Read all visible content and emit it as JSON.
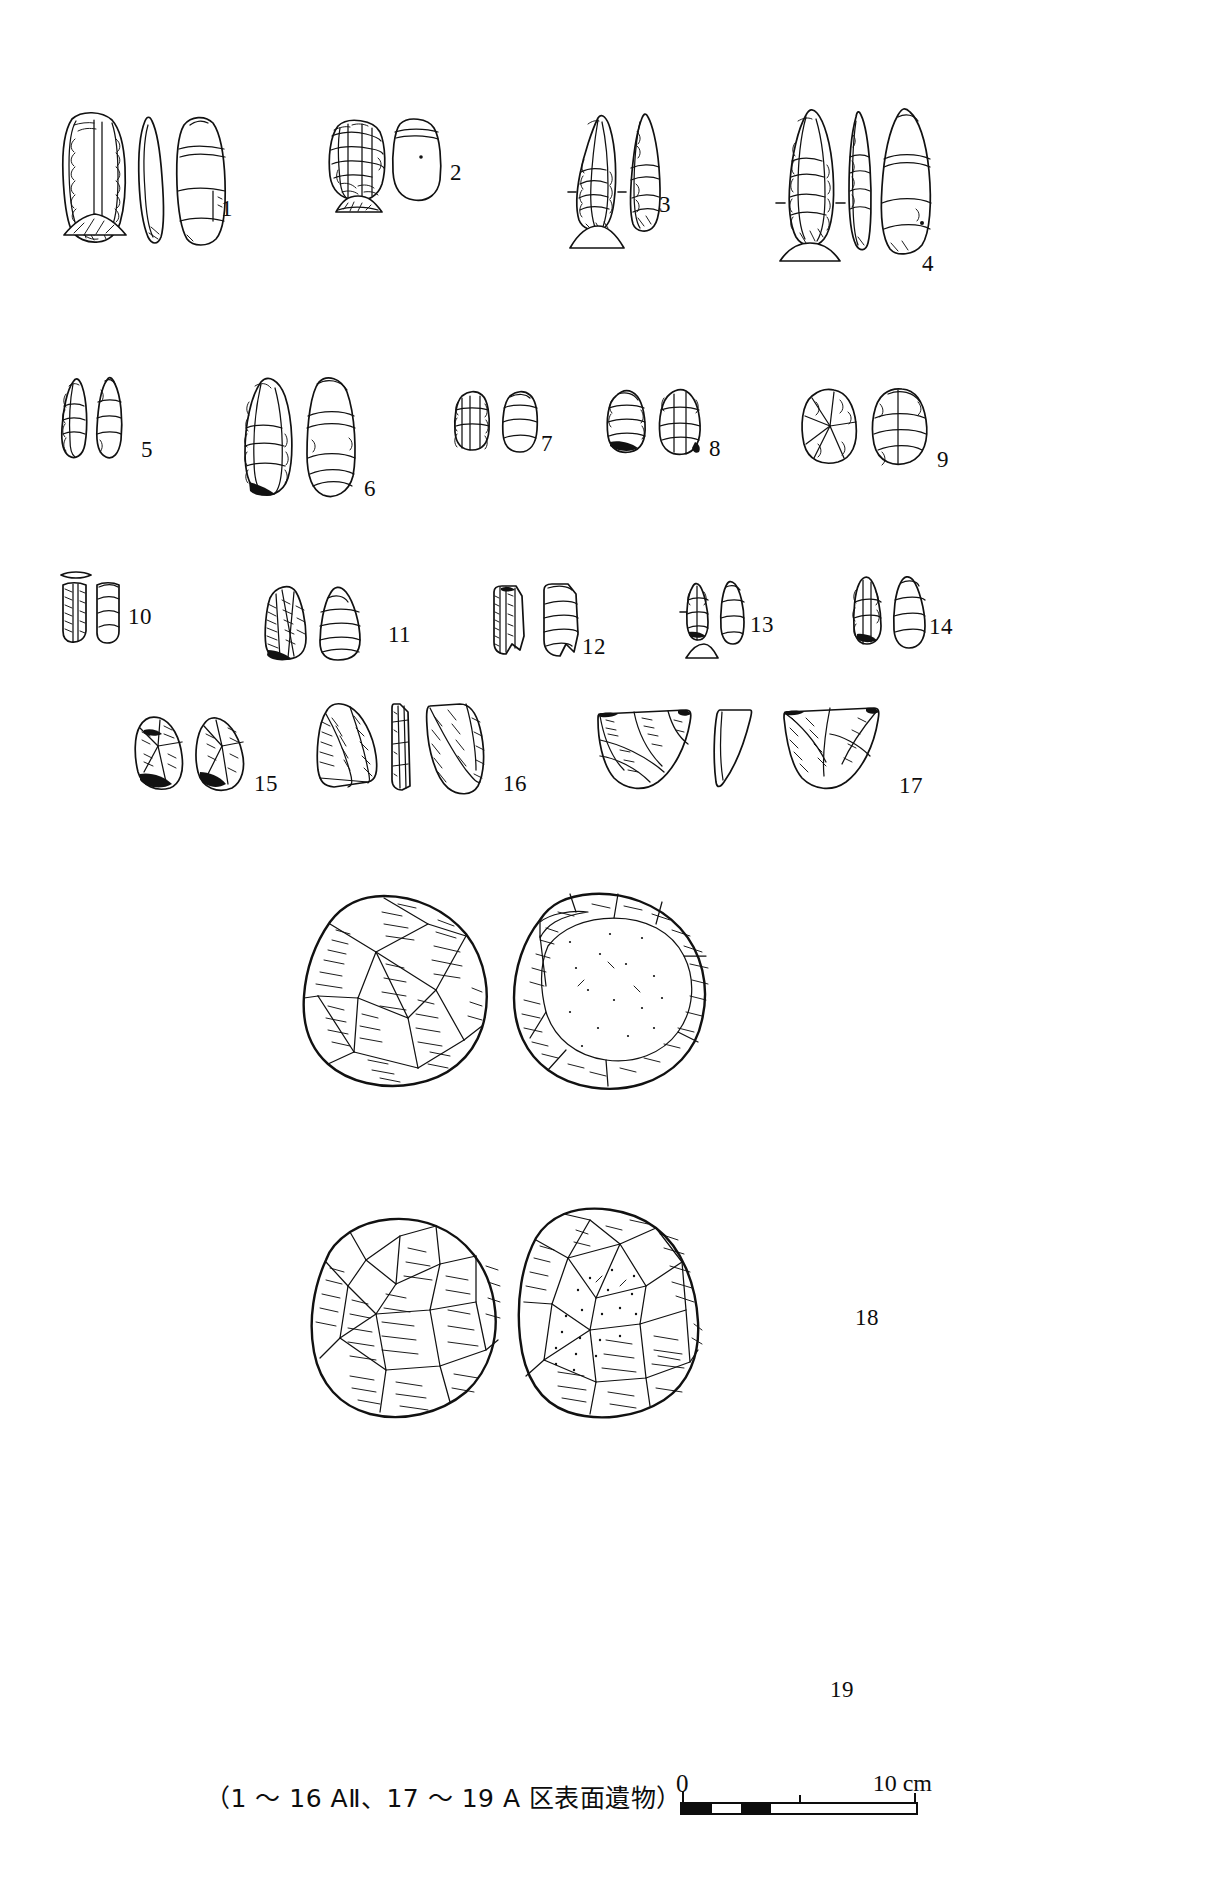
{
  "figure": {
    "caption": "（1 ～ 16 AⅡ、17 ～ 19 A 区表面遺物）",
    "scale": {
      "start_label": "0",
      "end_label": "10 cm",
      "unit": "cm",
      "length_cm": 10,
      "segments": 4
    },
    "ink_color": "#111111",
    "background_color": "#ffffff"
  },
  "artifacts": [
    {
      "number": "1",
      "views": 3,
      "section": true,
      "type": "blade-tool"
    },
    {
      "number": "2",
      "views": 2,
      "section": true,
      "type": "end-scraper"
    },
    {
      "number": "3",
      "views": 2,
      "section": true,
      "type": "point"
    },
    {
      "number": "4",
      "views": 3,
      "section": true,
      "type": "point"
    },
    {
      "number": "5",
      "views": 2,
      "section": false,
      "type": "backed-blade"
    },
    {
      "number": "6",
      "views": 2,
      "section": false,
      "type": "blade"
    },
    {
      "number": "7",
      "views": 2,
      "section": false,
      "type": "flake-tool"
    },
    {
      "number": "8",
      "views": 2,
      "section": false,
      "type": "flake-tool"
    },
    {
      "number": "9",
      "views": 2,
      "section": false,
      "type": "flake-tool"
    },
    {
      "number": "10",
      "views": 2,
      "section": true,
      "type": "blade-fragment"
    },
    {
      "number": "11",
      "views": 2,
      "section": false,
      "type": "flake"
    },
    {
      "number": "12",
      "views": 2,
      "section": false,
      "type": "flake"
    },
    {
      "number": "13",
      "views": 2,
      "section": true,
      "type": "micro-flake"
    },
    {
      "number": "14",
      "views": 2,
      "section": false,
      "type": "flake"
    },
    {
      "number": "15",
      "views": 2,
      "section": false,
      "type": "flake"
    },
    {
      "number": "16",
      "views": 3,
      "section": false,
      "type": "flake"
    },
    {
      "number": "17",
      "views": 3,
      "section": false,
      "type": "scraper"
    },
    {
      "number": "18",
      "views": 2,
      "section": false,
      "type": "core"
    },
    {
      "number": "19",
      "views": 2,
      "section": false,
      "type": "core"
    }
  ]
}
